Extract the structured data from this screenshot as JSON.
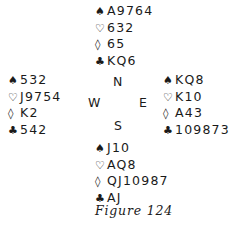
{
  "hands": {
    "north": {
      "spades": "A9764",
      "hearts": "632",
      "diamonds": "65",
      "clubs": "KQ6"
    },
    "west": {
      "spades": "532",
      "hearts": "J9754",
      "diamonds": "K2",
      "clubs": "542"
    },
    "east": {
      "spades": "KQ8",
      "hearts": "K10",
      "diamonds": "A43",
      "clubs": "109873"
    },
    "south": {
      "spades": "J10",
      "hearts": "AQ8",
      "diamonds": "QJ10987",
      "clubs": "AJ"
    }
  },
  "suit_symbols": {
    "spades": "♠",
    "hearts": "♡",
    "diamonds": "◊",
    "clubs": "♣"
  },
  "compass": {
    "north": "N",
    "west": "W",
    "east": "E",
    "south": "S"
  },
  "caption": "Figure 124"
}
